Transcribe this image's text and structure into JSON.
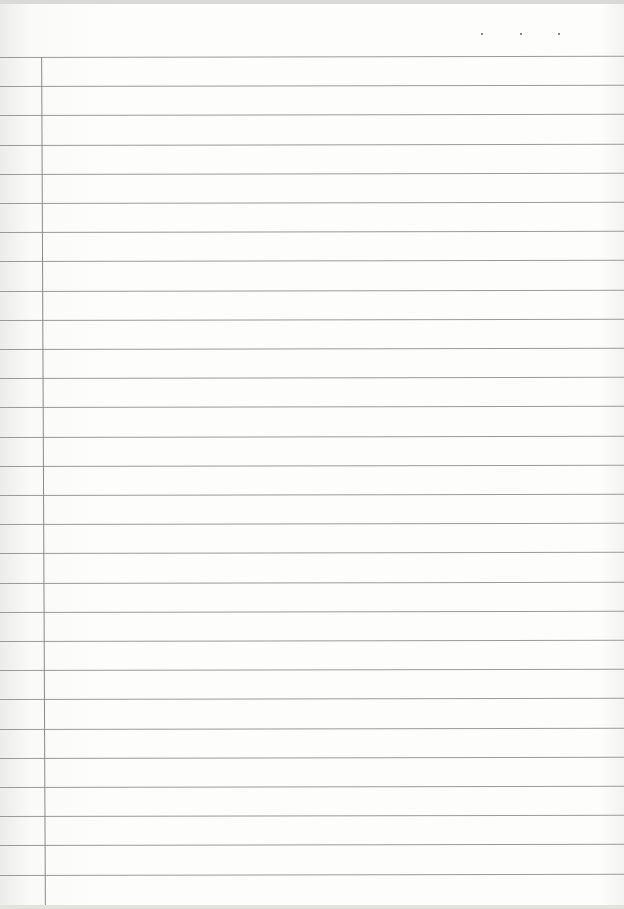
{
  "document": {
    "type": "lined-notebook-page",
    "rule_color": "#9a9a98",
    "margin_color": "#8a8a88",
    "line_count": 29,
    "first_line_y": 57,
    "line_spacing": 29.2,
    "margin_x": 43,
    "date_dots": [
      481,
      520,
      558
    ],
    "content": ""
  }
}
